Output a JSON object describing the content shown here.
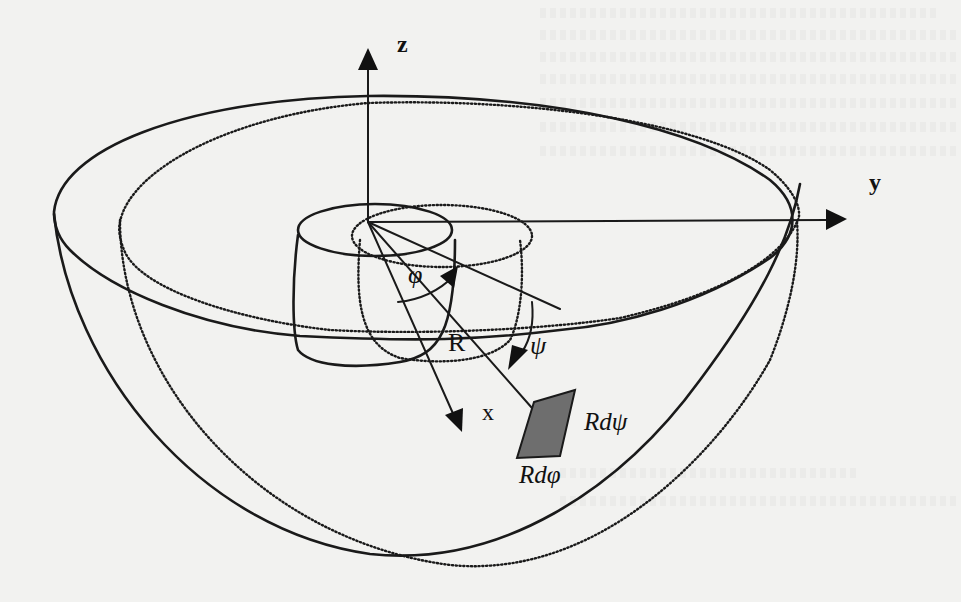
{
  "figure": {
    "type": "3D hemispherical shell diagram with coordinate axes",
    "axes": {
      "z": {
        "label": "z"
      },
      "y": {
        "label": "y"
      },
      "x": {
        "label": "x"
      }
    },
    "angles": {
      "phi": {
        "label": "φ"
      },
      "psi": {
        "label": "ψ"
      }
    },
    "radius_label": "R",
    "surface_element": {
      "label_psi": "Rdψ",
      "label_phi": "Rdφ",
      "fill_color": "#6e6e6e"
    },
    "line_color": "#1a1a1a",
    "background_color": "#f2f2f0"
  }
}
